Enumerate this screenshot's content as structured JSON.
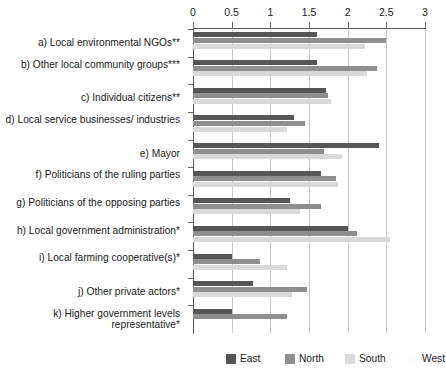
{
  "chart_data": {
    "type": "bar",
    "orientation": "horizontal",
    "title": "",
    "xlabel": "",
    "ylabel": "",
    "xlim": [
      0,
      3
    ],
    "xticks": [
      0,
      0.5,
      1,
      1.5,
      2,
      2.5,
      3
    ],
    "xticklabels": [
      "0",
      "0.5",
      "1",
      "1.5",
      "2",
      "2.5",
      "3"
    ],
    "grid": true,
    "legend_position": "bottom",
    "categories": [
      "a) Local environmental NGOs**",
      "b) Other local community groups***",
      "c) Individual citizens**",
      "d) Local service businesses/ industries",
      "e) Mayor",
      "f) Politicians of the ruling parties",
      "g) Politicians of the opposing parties",
      "h) Local government administration*",
      "i) Local farming cooperative(s)*",
      "j) Other private actors*",
      "k) Higher government levels representative*"
    ],
    "series": [
      {
        "name": "East",
        "color": "#565656",
        "values": [
          1.6,
          1.6,
          1.72,
          1.3,
          2.4,
          1.65,
          1.25,
          2.0,
          0.5,
          0.78,
          0.5
        ]
      },
      {
        "name": "North",
        "color": "#8f8f8f",
        "values": [
          2.5,
          2.38,
          1.74,
          1.45,
          1.7,
          1.85,
          1.65,
          2.12,
          0.87,
          1.47,
          1.22
        ]
      },
      {
        "name": "South",
        "color": "#d9d9d9",
        "values": [
          2.22,
          2.25,
          1.78,
          1.22,
          1.93,
          1.88,
          1.38,
          2.55,
          1.22,
          1.28,
          0.0
        ]
      },
      {
        "name": "West",
        "color": "#fdfdfd",
        "values": [
          0.0,
          0.0,
          0.0,
          0.0,
          0.0,
          0.0,
          0.0,
          0.0,
          0.0,
          0.0,
          0.0
        ]
      }
    ]
  },
  "legend": {
    "entries": [
      {
        "label": "East"
      },
      {
        "label": "North"
      },
      {
        "label": "South"
      },
      {
        "label": "West"
      }
    ]
  }
}
